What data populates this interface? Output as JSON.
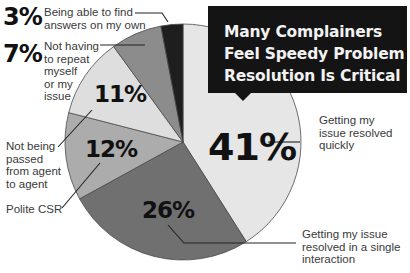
{
  "chart_data": {
    "type": "pie",
    "title": "Many Complainers Feel Speedy Problem Resolution Is Critical",
    "start_angle": "12 o'clock, clockwise",
    "slices": [
      {
        "label": "Getting my issue resolved quickly",
        "value": 41,
        "display": "41%",
        "color": "#e6e6e6"
      },
      {
        "label": "Getting my issue resolved in a single interaction",
        "value": 26,
        "display": "26%",
        "color": "#707070"
      },
      {
        "label": "Polite CSR",
        "value": 12,
        "display": "12%",
        "color": "#acacac"
      },
      {
        "label": "Not being passed from agent to agent",
        "value": 11,
        "display": "11%",
        "color": "#dedede"
      },
      {
        "label": "Not having to repeat myself or my issue",
        "value": 7,
        "display": "7%",
        "color": "#8c8c8c"
      },
      {
        "label": "Being able to find answers on my own",
        "value": 3,
        "display": "3%",
        "color": "#1e1e1e"
      }
    ],
    "legend": "none (leader-line callouts)"
  },
  "title": {
    "text": "Many Complainers\nFeel Speedy Problem\nResolution Is Critical"
  },
  "callouts": {
    "c41": {
      "pct": "41%",
      "text": "Getting my\nissue resolved\nquickly"
    },
    "c26": {
      "pct": "26%",
      "text": "Getting my issue\nresolved in a single\ninteraction"
    },
    "c12": {
      "pct": "12%",
      "text": "Polite CSR"
    },
    "c11": {
      "pct": "11%",
      "text": "Not being\npassed\nfrom agent\nto agent"
    },
    "c7": {
      "pct": "7%",
      "text": "Not having\nto repeat\nmyself\nor my\nissue"
    },
    "c3": {
      "pct": "3%",
      "text": "Being able to find\nanswers on my own"
    }
  }
}
